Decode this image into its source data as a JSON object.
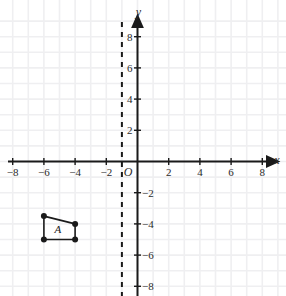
{
  "chart_data": {
    "type": "scatter",
    "title": "",
    "xlabel": "x",
    "ylabel": "y",
    "xlim": [
      -9,
      9
    ],
    "ylim": [
      -9,
      9
    ],
    "grid": true,
    "grid_step": 1,
    "axis_tick_step": 2,
    "origin_label": "O",
    "x_tick_labels": [
      "-8",
      "-6",
      "-4",
      "-2",
      "2",
      "4",
      "6",
      "8"
    ],
    "x_tick_values": [
      -8,
      -6,
      -4,
      -2,
      2,
      4,
      6,
      8
    ],
    "y_tick_labels": [
      "8",
      "6",
      "4",
      "2",
      "-2",
      "-4",
      "-6",
      "-8"
    ],
    "y_tick_values": [
      8,
      6,
      4,
      2,
      -2,
      -4,
      -6,
      -8
    ],
    "annotations": [
      {
        "name": "dashed-line-of-reflection",
        "type": "vertical-dashed-line",
        "x": -1,
        "label": "",
        "color": "#1a1a1a"
      }
    ],
    "series": [
      {
        "name": "Figure A",
        "label": "A",
        "type": "polygon",
        "closed": true,
        "color": "#1a1a1a",
        "vertex_marker": "filled-circle",
        "points": [
          {
            "x": -6,
            "y": -3.5
          },
          {
            "x": -4,
            "y": -4
          },
          {
            "x": -4,
            "y": -5
          },
          {
            "x": -6,
            "y": -5
          }
        ],
        "label_position": {
          "x": -5.1,
          "y": -4.3
        }
      }
    ]
  },
  "colors": {
    "background": "#ffffff",
    "grid": "#efeff1",
    "axis": "#1a1a1a",
    "shape_stroke": "#1a1a1a",
    "shape_vertex": "#1a1a1a",
    "dashed_line": "#1a1a1a",
    "text": "#2b2b2b"
  }
}
